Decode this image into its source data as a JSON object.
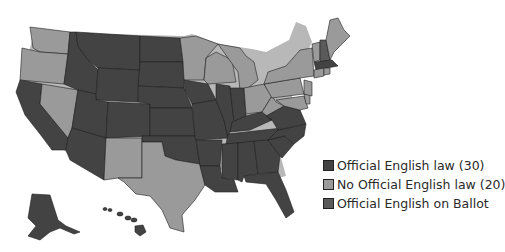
{
  "map": {
    "title": "",
    "colors": {
      "official": "#434343",
      "no_official": "#9a9a9a",
      "ballot": "#5a5a5a"
    },
    "states_no_official": [
      "WA",
      "OR",
      "NV",
      "NM",
      "TX",
      "MN",
      "WI",
      "MI",
      "OH",
      "PA",
      "NY",
      "VT",
      "ME",
      "MD",
      "DE",
      "NJ",
      "CT",
      "RI"
    ],
    "states_ballot": [
      "NH"
    ]
  },
  "legend": {
    "items": [
      {
        "label": "Official English law (30)",
        "color": "#434343"
      },
      {
        "label": "No Official English law (20)",
        "color": "#9a9a9a"
      },
      {
        "label": "Official English on Ballot",
        "color": "#5a5a5a"
      }
    ]
  }
}
